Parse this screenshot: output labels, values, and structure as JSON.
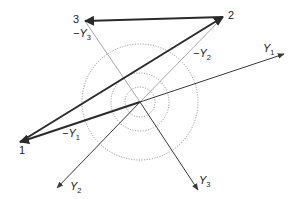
{
  "diagram": {
    "type": "phasor-vector-diagram",
    "origin": {
      "x": 140,
      "y": 102
    },
    "circles": [
      {
        "name": "inner-circle",
        "r": 15
      },
      {
        "name": "middle-circle",
        "r": 29
      },
      {
        "name": "outer-circle",
        "r": 58
      }
    ],
    "points": [
      {
        "id": "1",
        "label": "1",
        "x": 20,
        "y": 142,
        "label_x": 19,
        "label_y": 154
      },
      {
        "id": "2",
        "label": "2",
        "x": 223,
        "y": 17,
        "label_x": 228,
        "label_y": 19
      },
      {
        "id": "3",
        "label": "3",
        "x": 85,
        "y": 21,
        "label_x": 73,
        "label_y": 23
      }
    ],
    "axes": [
      {
        "name": "Y1",
        "base": "Y",
        "sub": "1",
        "x2": 284,
        "y2": 54,
        "label_x": 263,
        "label_y": 52
      },
      {
        "name": "Y2",
        "base": "Y",
        "sub": "2",
        "x2": 57,
        "y2": 188,
        "label_x": 70,
        "label_y": 190
      },
      {
        "name": "Y3",
        "base": "Y",
        "sub": "3",
        "x2": 198,
        "y2": 190,
        "label_x": 199,
        "label_y": 184
      }
    ],
    "negated_vectors": [
      {
        "name": "-Y1",
        "prefix": "−Y",
        "sub": "1",
        "to": "1",
        "style": "thick",
        "label_x": 62,
        "label_y": 137
      },
      {
        "name": "-Y2",
        "prefix": "−Y",
        "sub": "2",
        "to": "2",
        "style": "light",
        "label_x": 193,
        "label_y": 57
      },
      {
        "name": "-Y3",
        "prefix": "−Y",
        "sub": "3",
        "to": "3",
        "style": "light",
        "label_x": 73,
        "label_y": 37
      }
    ],
    "sides": [
      {
        "name": "side-1-2",
        "from": "1",
        "to": "2"
      },
      {
        "name": "side-2-3",
        "from": "2",
        "to": "3"
      }
    ],
    "colors": {
      "thick": "#2a2a2a",
      "axis": "#3a3a3a",
      "light": "#a8a8a8",
      "circle": "#8a8a8a",
      "text": "#222222"
    }
  }
}
